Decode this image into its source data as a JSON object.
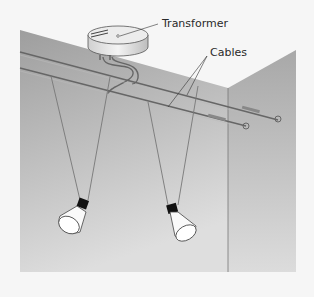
{
  "diagram": {
    "type": "illustration",
    "labels": {
      "transformer": "Transformer",
      "cables": "Cables"
    },
    "components": [
      "transformer",
      "two parallel cables",
      "two hanging spot lamps",
      "cable tensioners",
      "wall corner"
    ],
    "colors": {
      "background": "#f6f6f6",
      "wall_left": "#a9a9a9",
      "wall_right": "#b6b6b6",
      "cable": "#666666",
      "label_text": "#2a2a2a"
    }
  }
}
